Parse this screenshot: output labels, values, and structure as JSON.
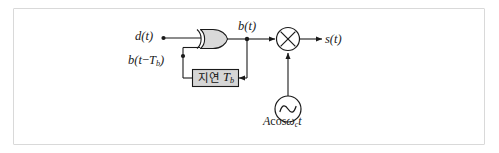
{
  "figure": {
    "kind": "block-diagram",
    "frame_color": "#d9d9d9",
    "line_color": "#1a1a1a",
    "block_fill": "#d6d6d6"
  },
  "labels": {
    "input_signal": "d(t)",
    "encoded_signal": "b(t)",
    "delayed_signal_prefix": "b(t",
    "delayed_signal_minus": "−",
    "delayed_signal_sub": "b",
    "delayed_signal_suffix": ")",
    "output_signal": "s(t)",
    "delay_block_text": "지연",
    "delay_block_symbol": "T",
    "delay_block_symbol_sub": "b",
    "carrier_amplitude": "A",
    "carrier_cos": "cos",
    "carrier_omega": "ω",
    "carrier_omega_sub": "c",
    "carrier_time": "t"
  },
  "blocks": {
    "xor_gate": "XOR",
    "delay": "지연 Tₕ",
    "multiplier": "×",
    "oscillator": "∼"
  }
}
